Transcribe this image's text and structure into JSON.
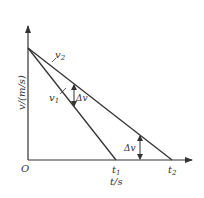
{
  "diagram": {
    "type": "v-t graph",
    "y_axis_label": "v/(m/s)",
    "x_axis_label": "t/s",
    "origin_label": "O",
    "lines": [
      {
        "name": "v1",
        "label": "v",
        "sub": "1"
      },
      {
        "name": "v2",
        "label": "v",
        "sub": "2"
      }
    ],
    "tick_labels": [
      {
        "label": "t",
        "sub": "1"
      },
      {
        "label": "t",
        "sub": "2"
      }
    ],
    "annotations": [
      "Δv",
      "Δv"
    ]
  }
}
